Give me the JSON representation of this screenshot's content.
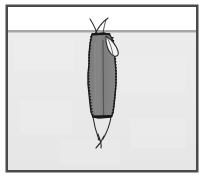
{
  "figure": {
    "title": "Sectional illustration of an elongated serrated-bodied organism straddling a horizontal surface line",
    "kind": "scientific-line-illustration",
    "canvas": {
      "width": 204,
      "height": 179
    },
    "frame": {
      "label": "illustration-frame",
      "x": 6,
      "y": 5,
      "width": 192,
      "height": 167,
      "stroke_color": "#4a4a4a",
      "stroke_width": 3,
      "fill_color": "#ffffff"
    },
    "regions": [
      {
        "name": "upper-field",
        "label": "Upper white field",
        "fill_color": "#ffffff",
        "x": 8,
        "y": 7,
        "width": 188,
        "height": 24
      },
      {
        "name": "lower-field",
        "label": "Lower shaded field",
        "fill_color": "#e9e9e9",
        "x": 8,
        "y": 31,
        "width": 188,
        "height": 139
      }
    ],
    "surface_line": {
      "label": "Horizontal surface boundary",
      "y": 31,
      "x_start": 8,
      "x_end": 196,
      "stroke_color": "#8c8c8c",
      "stroke_width": 1.6
    },
    "body": {
      "label": "Main body",
      "fill_color": "#808080",
      "stroke_color": "#1c1c1c",
      "stroke_width": 1.4,
      "top_y": 33,
      "bottom_y": 118,
      "left_x": 88,
      "right_x": 118,
      "edge_texture": "serrated-dotted",
      "midline": {
        "label": "Body midline",
        "x": 103,
        "y_start": 40,
        "y_end": 117,
        "stroke_color": "#4e4e4e"
      }
    },
    "appendages": [
      {
        "name": "dorsal-fin-flap",
        "label": "Upper right curved flap",
        "stroke_color": "#2a2a2a",
        "fill_color": "#f2f2f2"
      },
      {
        "name": "antenna-left",
        "label": "Left antenna filament",
        "stroke_color": "#2a2a2a"
      },
      {
        "name": "antenna-right",
        "label": "Right antenna filament",
        "stroke_color": "#2a2a2a"
      },
      {
        "name": "tail-cercus-left",
        "label": "Left tail filament",
        "stroke_color": "#2a2a2a"
      },
      {
        "name": "tail-cercus-right",
        "label": "Right tail filament",
        "stroke_color": "#2a2a2a"
      },
      {
        "name": "tail-tip",
        "label": "Crossed tail tip",
        "stroke_color": "#2a2a2a"
      }
    ],
    "palette": {
      "frame_border": "#4a4a4a",
      "upper_field": "#ffffff",
      "lower_field": "#e9e9e9",
      "surface_line": "#8c8c8c",
      "body_fill": "#808080",
      "body_outline": "#1c1c1c",
      "filament": "#2a2a2a"
    }
  }
}
